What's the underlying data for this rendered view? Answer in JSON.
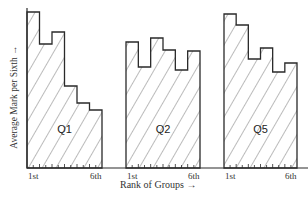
{
  "chart_data": {
    "type": "bar",
    "title": "",
    "xlabel": "Rank of Groups",
    "ylabel": "Average Mark per Sixth",
    "categories": [
      "1st",
      "2nd",
      "3rd",
      "4th",
      "5th",
      "6th"
    ],
    "tick_labels": {
      "first": "1st",
      "last": "6th"
    },
    "series": [
      {
        "name": "Q1",
        "values": [
          156,
          124,
          136,
          82,
          65,
          58
        ]
      },
      {
        "name": "Q2",
        "values": [
          126,
          101,
          130,
          118,
          98,
          117
        ]
      },
      {
        "name": "Q5",
        "values": [
          154,
          143,
          109,
          120,
          96,
          105
        ]
      }
    ],
    "units": "relative (pixel height, no numeric axis shown)",
    "grid": false,
    "legend": "none (panel labels inside bars)",
    "fill": "diagonal hatching"
  },
  "axis": {
    "x_arrow": "→",
    "y_arrow": "→"
  },
  "colors": {
    "stroke": "#2a2a2a",
    "hatch": "#555555",
    "background": "#ffffff"
  }
}
